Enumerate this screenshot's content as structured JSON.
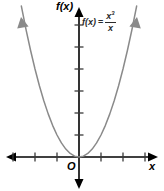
{
  "figure": {
    "width": 164,
    "height": 191,
    "background_color": "#ffffff"
  },
  "labels": {
    "y_axis": "f(x)",
    "x_axis": "x",
    "origin": "O",
    "equation_lhs": "f(x)",
    "equation_equals": "=",
    "equation_numerator_base": "x",
    "equation_numerator_exponent": "3",
    "equation_denominator": "x"
  },
  "colors": {
    "axis": "#000000",
    "curve": "#8a8a8a",
    "tick": "#3a3a3a",
    "text": "#000000",
    "equation_text": "#2b2b2b"
  },
  "chart_data": {
    "type": "line",
    "title": "",
    "subtitle": "",
    "xlabel": "x",
    "ylabel": "f(x)",
    "annotations": [
      "f(x) = x³/x",
      "O"
    ],
    "legend": [],
    "legend_position": "none",
    "grid": false,
    "axis_origin_label": "O",
    "xlim": [
      -3.6,
      3.6
    ],
    "ylim": [
      -1.1,
      7.2
    ],
    "xticks": [
      -3,
      -2,
      -1,
      1,
      2,
      3
    ],
    "yticks": [
      1,
      2,
      3,
      4,
      5,
      6
    ],
    "xtick_labels": [],
    "ytick_labels": [],
    "axis_arrows": [
      "up",
      "down",
      "left",
      "right"
    ],
    "curve_arrows": [
      "upper-left",
      "upper-right"
    ],
    "series": [
      {
        "name": "f(x) = x³/x",
        "formula": "y = x^2",
        "color": "#8a8a8a",
        "x": [
          -2.62,
          -2.4,
          -2.2,
          -2.0,
          -1.8,
          -1.6,
          -1.4,
          -1.2,
          -1.0,
          -0.8,
          -0.6,
          -0.4,
          -0.2,
          0,
          0.2,
          0.4,
          0.6,
          0.8,
          1.0,
          1.2,
          1.4,
          1.6,
          1.8,
          2.0,
          2.2,
          2.4,
          2.62
        ],
        "y": [
          6.86,
          5.76,
          4.84,
          4.0,
          3.24,
          2.56,
          1.96,
          1.44,
          1.0,
          0.64,
          0.36,
          0.16,
          0.04,
          0,
          0.04,
          0.16,
          0.36,
          0.64,
          1.0,
          1.44,
          1.96,
          2.56,
          3.24,
          4.0,
          4.84,
          5.76,
          6.86
        ]
      }
    ]
  },
  "geometry": {
    "origin_px": {
      "x": 79,
      "y": 157
    },
    "px_per_unit_x": 22,
    "px_per_unit_y": 22
  }
}
